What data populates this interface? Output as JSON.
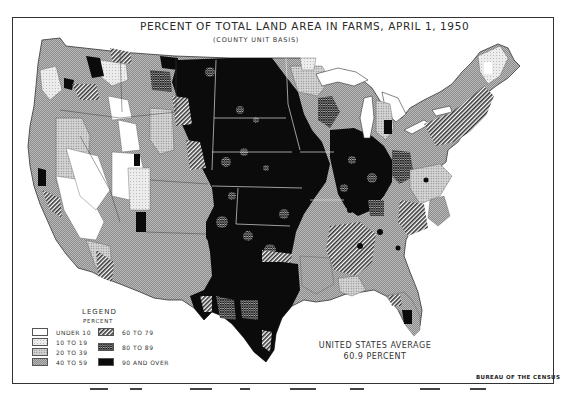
{
  "map": {
    "title": "PERCENT OF TOTAL LAND AREA IN FARMS, APRIL 1, 1950",
    "subtitle": "(COUNTY UNIT BASIS)",
    "region": "United States (contiguous)",
    "legend": {
      "title": "LEGEND",
      "subtitle": "PERCENT",
      "items": [
        {
          "label": "UNDER 10",
          "pattern": "blank",
          "color": "#ffffff"
        },
        {
          "label": "10 TO 19",
          "pattern": "light-stipple",
          "color": "#dcdcdc"
        },
        {
          "label": "20 TO 39",
          "pattern": "medium-stipple",
          "color": "#bdbdbd"
        },
        {
          "label": "40 TO 59",
          "pattern": "dense-stipple",
          "color": "#9a9a9a"
        },
        {
          "label": "60 TO 79",
          "pattern": "diagonal-hatch",
          "color": "#6e6e6e"
        },
        {
          "label": "80 TO 89",
          "pattern": "crosshatch",
          "color": "#3a3a3a"
        },
        {
          "label": "90 AND OVER",
          "pattern": "solid",
          "color": "#0a0a0a"
        }
      ]
    },
    "average": {
      "line1": "UNITED STATES AVERAGE",
      "line2": "60.9 PERCENT"
    },
    "credit": "BUREAU OF THE CENSUS"
  }
}
